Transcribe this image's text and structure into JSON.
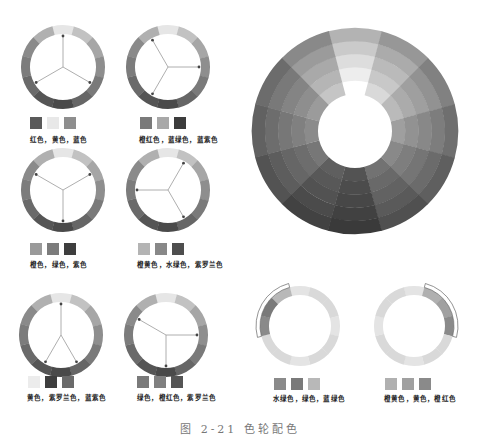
{
  "palette": {
    "segments_gray": [
      "#e6e6e6",
      "#c2c2c2",
      "#a6a6a6",
      "#8e8e8e",
      "#7a7a7a",
      "#666666",
      "#4a4a4a",
      "#555555",
      "#6a6a6a",
      "#7c7c7c",
      "#8a8a8a",
      "#b0b0b0"
    ],
    "segment_names": [
      "黄色",
      "橙黄色",
      "橙色",
      "橙红色",
      "红色",
      "紫罗兰色",
      "紫色",
      "蓝紫色",
      "蓝色",
      "蓝绿色",
      "绿色",
      "水绿色"
    ]
  },
  "schemes": [
    {
      "id": "triad-1",
      "label": "红色，黄色，蓝色",
      "swatches": [
        "#5a5a5a",
        "#e8e8e8",
        "#8e8e8e"
      ],
      "arrows": [
        0,
        4,
        8
      ]
    },
    {
      "id": "triad-2",
      "label": "橙红色，蓝绿色，蓝紫色",
      "swatches": [
        "#7a7a7a",
        "#a8a8a8",
        "#3c3c3c"
      ],
      "arrows": [
        3,
        7,
        11
      ]
    },
    {
      "id": "triad-3",
      "label": "橙色，绿色，紫色",
      "swatches": [
        "#9a9a9a",
        "#7c7c7c",
        "#3e3e3e"
      ],
      "arrows": [
        2,
        6,
        10
      ]
    },
    {
      "id": "triad-4",
      "label": "橙黄色，水绿色，紫罗兰色",
      "swatches": [
        "#b4b4b4",
        "#888888",
        "#4e4e4e"
      ],
      "arrows": [
        1,
        5,
        9
      ]
    },
    {
      "id": "split-1",
      "label": "黄色，紫罗兰色，蓝紫色",
      "swatches": [
        "#ececec",
        "#3e3e3e",
        "#6a6a6a"
      ],
      "arrows": [
        0,
        5,
        7
      ]
    },
    {
      "id": "split-2",
      "label": "绿色，橙红色，紫罗兰色",
      "swatches": [
        "#7a7a7a",
        "#808080",
        "#555555"
      ],
      "arrows": [
        3,
        6,
        10
      ]
    },
    {
      "id": "analog-1",
      "label": "水绿色，绿色，蓝绿色",
      "swatches": [
        "#8a8a8a",
        "#7a7a7a",
        "#b8b8b8"
      ],
      "highlight": [
        9,
        10,
        11
      ]
    },
    {
      "id": "analog-2",
      "label": "橙黄色，黄色，橙红色",
      "swatches": [
        "#b0b0b0",
        "#a0a0a0",
        "#8a8a8a"
      ],
      "highlight": [
        1,
        2,
        3
      ]
    }
  ],
  "caption": "图 2-21  色轮配色"
}
